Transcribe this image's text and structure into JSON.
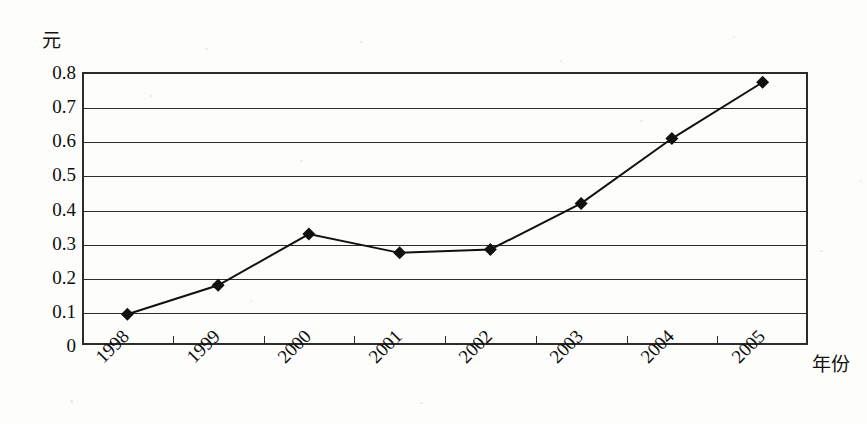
{
  "chart_data": {
    "type": "line",
    "title": "",
    "xlabel": "年份",
    "ylabel": "元",
    "unit_label": "元",
    "categories": [
      "1998",
      "1999",
      "2000",
      "2001",
      "2002",
      "2003",
      "2004",
      "2005"
    ],
    "values": [
      0.09,
      0.175,
      0.325,
      0.27,
      0.28,
      0.415,
      0.605,
      0.77
    ],
    "series": [
      {
        "name": "",
        "values": [
          0.09,
          0.175,
          0.325,
          0.27,
          0.28,
          0.415,
          0.605,
          0.77
        ]
      }
    ],
    "ylim": [
      0,
      0.8
    ],
    "yticks": [
      "0",
      "0.1",
      "0.2",
      "0.3",
      "0.4",
      "0.5",
      "0.6",
      "0.7",
      "0.8"
    ],
    "ytick_values": [
      0,
      0.1,
      0.2,
      0.3,
      0.4,
      0.5,
      0.6,
      0.7,
      0.8
    ],
    "grid": "horizontal",
    "legend": "none",
    "marker": "diamond",
    "line_color": "#111111",
    "marker_color": "#111111",
    "frame_color": "#2b2b2b",
    "background_color": "#fdfdfb"
  },
  "axis": {
    "y_unit": "元",
    "x_title": "年份"
  }
}
